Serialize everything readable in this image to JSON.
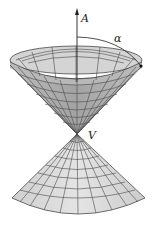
{
  "figure": {
    "type": "double-cone",
    "labels": {
      "axis": "A",
      "angle": "α",
      "vertex": "V"
    },
    "colors": {
      "surface_top_inner": "#cfcfcf",
      "surface_top_outer": "#a9a9a9",
      "surface_bottom": "#dcdcdc",
      "grid": "#4a4a4a",
      "axis": "#222222"
    }
  }
}
